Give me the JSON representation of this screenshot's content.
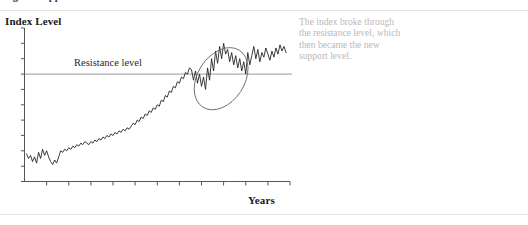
{
  "figure": {
    "title": "Figure  Support and resistance levels",
    "y_axis_title": "Index Level",
    "x_axis_title": "Years",
    "resistance_label": "Resistance level",
    "annotation": "The index broke through the resistance level, which then became the new support level.",
    "colors": {
      "series_line": "#1a1a1a",
      "resistance_line": "#9a9a9a",
      "axis": "#555555",
      "ellipse": "#6e6e6e",
      "annotation_text": "#b9b9b9",
      "background": "#ffffff"
    }
  },
  "chart_data": {
    "type": "line",
    "title": "Support and resistance levels",
    "xlabel": "Years",
    "ylabel": "Index Level",
    "grid": false,
    "legend": false,
    "xlim": [
      0,
      100
    ],
    "ylim": [
      0,
      100
    ],
    "x_tick_count": 12,
    "y_tick_count": 11,
    "tick_labels_shown": false,
    "annotations": [
      {
        "name": "resistance-level-line",
        "type": "hline",
        "label": "Resistance level",
        "y": 70,
        "x_start": 0,
        "x_end": 100
      },
      {
        "name": "breakout-ellipse",
        "type": "ellipse",
        "center_x": 75,
        "center_y": 67,
        "radius_x": 9,
        "radius_y": 22,
        "rotation_deg": 33
      },
      {
        "name": "side-note",
        "type": "text",
        "text": "The index broke through the resistance level, which then became the new support level."
      }
    ],
    "series": [
      {
        "name": "Index",
        "values": [
          18,
          15,
          17,
          13,
          16,
          12,
          19,
          15,
          21,
          17,
          20,
          16,
          13,
          11,
          14,
          12,
          16,
          20,
          19,
          21,
          20,
          22,
          21,
          23,
          22,
          24,
          23,
          25,
          24,
          26,
          25,
          24,
          26,
          25,
          27,
          26,
          28,
          27,
          29,
          28,
          30,
          29,
          31,
          30,
          32,
          31,
          33,
          32,
          34,
          33,
          35,
          34,
          36,
          38,
          37,
          40,
          39,
          42,
          41,
          44,
          43,
          46,
          45,
          48,
          47,
          50,
          49,
          53,
          52,
          56,
          55,
          59,
          58,
          62,
          61,
          65,
          64,
          68,
          67,
          71,
          70,
          74,
          73,
          66,
          72,
          64,
          70,
          62,
          68,
          60,
          74,
          66,
          80,
          72,
          85,
          77,
          88,
          80,
          90,
          83,
          86,
          78,
          84,
          76,
          82,
          74,
          80,
          72,
          78,
          70,
          84,
          76,
          82,
          88,
          80,
          86,
          78,
          84,
          81,
          87,
          83,
          79,
          85,
          81,
          87,
          83,
          89,
          85,
          88,
          84
        ]
      }
    ]
  }
}
